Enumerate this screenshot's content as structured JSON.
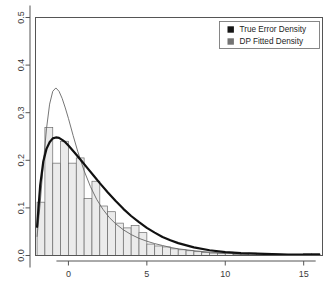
{
  "chart_data": {
    "type": "bar",
    "title": "",
    "subtitle": "",
    "xlabel": "",
    "ylabel": "",
    "xlim": [
      -2.1,
      16.2
    ],
    "ylim": [
      0.0,
      0.5
    ],
    "grid": false,
    "legend_position": "top-right",
    "x_ticks": [
      "0",
      "5",
      "10",
      "15"
    ],
    "x_tick_values": [
      0,
      5,
      10,
      15
    ],
    "y_ticks": [
      "0.0",
      "0.1",
      "0.2",
      "0.3",
      "0.4",
      "0.5"
    ],
    "y_tick_values": [
      0.0,
      0.1,
      0.2,
      0.3,
      0.4,
      0.5
    ],
    "bin_width": 0.5,
    "categories": [
      "-2.0",
      "-1.5",
      "-1.0",
      "-0.5",
      "0.0",
      "0.5",
      "1.0",
      "1.5",
      "2.0",
      "2.5",
      "3.0",
      "3.5",
      "4.0",
      "4.5",
      "5.0",
      "5.5",
      "6.0",
      "6.5",
      "7.0",
      "7.5",
      "8.0",
      "8.5",
      "9.0",
      "9.5",
      "10.0",
      "10.5",
      "11.0",
      "11.5",
      "12.0",
      "12.5",
      "13.0",
      "13.5",
      "14.0",
      "14.5",
      "15.0",
      "15.5"
    ],
    "values": [
      0.112,
      0.269,
      0.194,
      0.24,
      0.194,
      0.205,
      0.12,
      0.156,
      0.104,
      0.092,
      0.068,
      0.058,
      0.063,
      0.048,
      0.024,
      0.02,
      0.018,
      0.014,
      0.012,
      0.01,
      0.008,
      0.006,
      0.005,
      0.004,
      0.007,
      0.002,
      0.002,
      0.005,
      0.001,
      0.001,
      0.001,
      0.001,
      0.001,
      0.001,
      0.004,
      0.004
    ],
    "series": [
      {
        "name": "True Error Density",
        "type": "line",
        "color": "#111111",
        "line_width": 2.2,
        "x": [
          -2.0,
          -1.8,
          -1.6,
          -1.4,
          -1.2,
          -1.0,
          -0.8,
          -0.6,
          -0.4,
          -0.2,
          0.0,
          0.4,
          0.8,
          1.2,
          1.6,
          2.0,
          2.5,
          3.0,
          3.5,
          4.0,
          4.5,
          5.0,
          5.5,
          6.0,
          6.5,
          7.0,
          8.0,
          9.0,
          10.0,
          11.0,
          12.0,
          13.0,
          14.0,
          15.0,
          16.0
        ],
        "y": [
          0.06,
          0.148,
          0.198,
          0.224,
          0.238,
          0.246,
          0.248,
          0.247,
          0.243,
          0.238,
          0.231,
          0.216,
          0.2,
          0.184,
          0.168,
          0.152,
          0.133,
          0.115,
          0.098,
          0.083,
          0.07,
          0.058,
          0.048,
          0.039,
          0.032,
          0.026,
          0.017,
          0.011,
          0.007,
          0.005,
          0.004,
          0.003,
          0.002,
          0.002,
          0.002
        ]
      },
      {
        "name": "DP Fitted Density",
        "type": "line",
        "color": "#666666",
        "line_width": 0.9,
        "x": [
          -2.0,
          -1.8,
          -1.6,
          -1.4,
          -1.2,
          -1.0,
          -0.8,
          -0.6,
          -0.4,
          -0.2,
          0.0,
          0.3,
          0.6,
          1.0,
          1.4,
          1.8,
          2.2,
          2.6,
          3.0,
          3.5,
          4.0,
          4.5,
          5.0,
          5.5,
          6.0,
          6.5,
          7.0,
          8.0,
          9.0,
          10.0,
          11.0,
          12.0,
          13.0,
          14.0,
          15.0,
          16.0
        ],
        "y": [
          0.04,
          0.11,
          0.193,
          0.266,
          0.318,
          0.345,
          0.352,
          0.345,
          0.33,
          0.31,
          0.288,
          0.252,
          0.218,
          0.178,
          0.145,
          0.118,
          0.097,
          0.08,
          0.067,
          0.054,
          0.044,
          0.036,
          0.03,
          0.025,
          0.021,
          0.017,
          0.014,
          0.01,
          0.007,
          0.005,
          0.004,
          0.003,
          0.003,
          0.002,
          0.002,
          0.002
        ]
      }
    ],
    "bar_fill": "#ebebeb",
    "bar_stroke": "#6b6b6b",
    "frame_color": "#555555",
    "axis_text_color": "#3a3a3a"
  },
  "legend": {
    "border_color": "#7a7a7a",
    "items": [
      {
        "label": "True Error Density",
        "swatch": "#151515",
        "marker": "filled-square"
      },
      {
        "label": "DP Fitted Density",
        "swatch": "#737373",
        "marker": "filled-square"
      }
    ]
  }
}
